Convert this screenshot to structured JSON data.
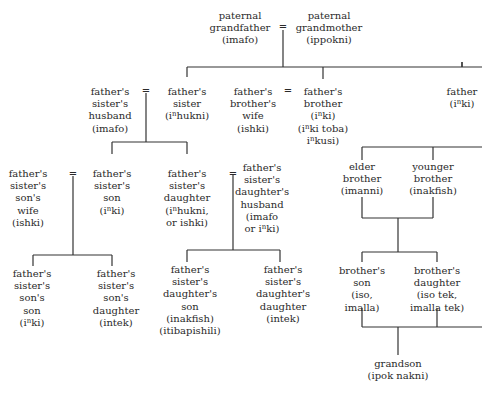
{
  "diagram": {
    "type": "kinship-chart",
    "equals_symbol": "=",
    "line_color": "#333333",
    "nodes": [
      {
        "id": "pgf",
        "lines": [
          "paternal",
          "grandfather",
          "(imafo)"
        ]
      },
      {
        "id": "pgm",
        "lines": [
          "paternal",
          "grandmother",
          "(ippokni)"
        ]
      },
      {
        "id": "fsh",
        "lines": [
          "father's",
          "sister's",
          "husband",
          "(imafo)"
        ]
      },
      {
        "id": "fs",
        "lines": [
          "father's",
          "sister",
          "(i^hukni)"
        ]
      },
      {
        "id": "fbw",
        "lines": [
          "father's",
          "brother's",
          "wife",
          "(ishki)"
        ]
      },
      {
        "id": "fb",
        "lines": [
          "father's",
          "brother",
          "(i^ki)",
          "(i^ki toba)",
          "i^kusi)"
        ]
      },
      {
        "id": "f",
        "lines": [
          "father",
          "(i^ki)"
        ]
      },
      {
        "id": "fssw",
        "lines": [
          "father's",
          "sister's",
          "son's",
          "wife",
          "(ishki)"
        ]
      },
      {
        "id": "fss",
        "lines": [
          "father's",
          "sister's",
          "son",
          "(i^ki)"
        ]
      },
      {
        "id": "fsd",
        "lines": [
          "father's",
          "sister's",
          "daughter",
          "(i^hukni,",
          "or ishki)"
        ]
      },
      {
        "id": "fsdh",
        "lines": [
          "father's",
          "sister's",
          "daughter's",
          "husband",
          "(imafo",
          "or i^ki)"
        ]
      },
      {
        "id": "eb",
        "lines": [
          "elder",
          "brother",
          "(imanni)"
        ]
      },
      {
        "id": "yb",
        "lines": [
          "younger",
          "brother",
          "(inakfish)"
        ]
      },
      {
        "id": "fsss",
        "lines": [
          "father's",
          "sister's",
          "son's",
          "son",
          "(i^ki)"
        ]
      },
      {
        "id": "fssd",
        "lines": [
          "father's",
          "sister's",
          "son's",
          "daughter",
          "(intek)"
        ]
      },
      {
        "id": "fsds",
        "lines": [
          "father's",
          "sister's",
          "daughter's",
          "son",
          "(inakfish)",
          "(itibapishili)"
        ]
      },
      {
        "id": "fsdd",
        "lines": [
          "father's",
          "sister's",
          "daughter's",
          "daughter",
          "(intek)"
        ]
      },
      {
        "id": "bs",
        "lines": [
          "brother's",
          "son",
          "(iso,",
          "imalla)"
        ]
      },
      {
        "id": "bd",
        "lines": [
          "brother's",
          "daughter",
          "(iso tek,",
          "imalla tek)"
        ]
      },
      {
        "id": "gs",
        "lines": [
          "grandson",
          "(ipok nakni)"
        ]
      }
    ]
  }
}
